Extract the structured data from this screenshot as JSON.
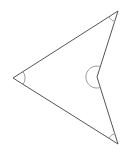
{
  "diagram": {
    "type": "concave-quadrilateral",
    "shape": "dart / arrowhead",
    "vertices": {
      "top": [
        118,
        11
      ],
      "left": [
        13,
        78
      ],
      "reflex": [
        97,
        77
      ],
      "bottom": [
        118,
        144
      ]
    },
    "angle_marks": [
      {
        "vertex": "top",
        "kind": "acute"
      },
      {
        "vertex": "left",
        "kind": "acute"
      },
      {
        "vertex": "bottom",
        "kind": "acute"
      },
      {
        "vertex": "reflex",
        "kind": "reflex"
      }
    ],
    "colors": {
      "edge": "#555555",
      "angle_arc": "#9a9a9a",
      "background": "#ffffff"
    }
  }
}
